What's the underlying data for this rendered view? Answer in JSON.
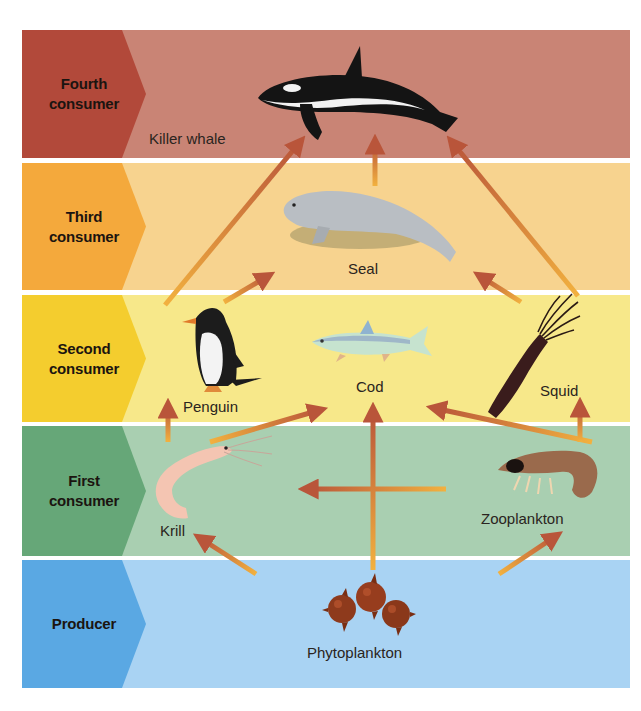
{
  "levels": [
    {
      "id": "fourth",
      "label_line1": "Fourth",
      "label_line2": "consumer",
      "band_color": "#c98475",
      "chevron_color": "#b2493a"
    },
    {
      "id": "third",
      "label_line1": "Third",
      "label_line2": "consumer",
      "band_color": "#f7d38f",
      "chevron_color": "#f4a93c"
    },
    {
      "id": "second",
      "label_line1": "Second",
      "label_line2": "consumer",
      "band_color": "#f7e88a",
      "chevron_color": "#f4cd2e"
    },
    {
      "id": "first",
      "label_line1": "First",
      "label_line2": "consumer",
      "band_color": "#a9cfb1",
      "chevron_color": "#66a778"
    },
    {
      "id": "producer",
      "label_line1": "Producer",
      "label_line2": "",
      "band_color": "#a9d3f3",
      "chevron_color": "#5aa8e3"
    }
  ],
  "organisms": {
    "killer_whale": "Killer whale",
    "seal": "Seal",
    "penguin": "Penguin",
    "cod": "Cod",
    "squid": "Squid",
    "krill": "Krill",
    "zooplankton": "Zooplankton",
    "phytoplankton": "Phytoplankton"
  },
  "feeding_links": [
    {
      "from": "penguin",
      "to": "killer_whale"
    },
    {
      "from": "seal",
      "to": "killer_whale"
    },
    {
      "from": "squid",
      "to": "killer_whale"
    },
    {
      "from": "penguin",
      "to": "seal"
    },
    {
      "from": "squid",
      "to": "seal"
    },
    {
      "from": "krill",
      "to": "penguin"
    },
    {
      "from": "krill",
      "to": "cod"
    },
    {
      "from": "zooplankton",
      "to": "cod"
    },
    {
      "from": "zooplankton",
      "to": "squid"
    },
    {
      "from": "zooplankton",
      "to": "krill"
    },
    {
      "from": "phytoplankton",
      "to": "cod"
    },
    {
      "from": "phytoplankton",
      "to": "krill"
    },
    {
      "from": "phytoplankton",
      "to": "zooplankton"
    }
  ],
  "colors": {
    "arrow_head": "#b9553a",
    "arrow_tail": "#f2b13f"
  }
}
